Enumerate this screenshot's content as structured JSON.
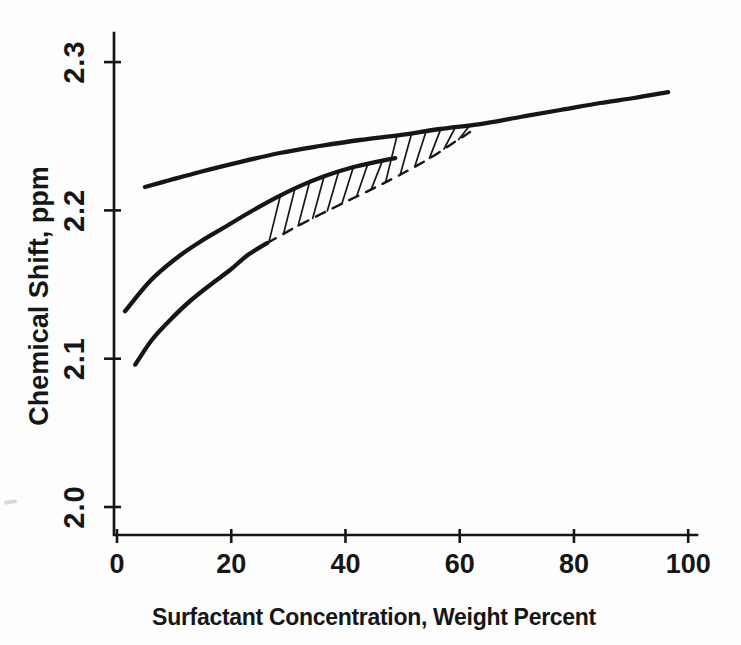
{
  "figure": {
    "background": "#fdfdfd",
    "ink_color": "#161616"
  },
  "chart_data": {
    "type": "line",
    "title": "",
    "xlabel": "Surfactant Concentration, Weight Percent",
    "ylabel": "Chemical Shift, ppm",
    "xlim": [
      0,
      101.5
    ],
    "ylim": [
      1.98,
      2.32
    ],
    "grid": false,
    "legend": "none",
    "x_ticks": {
      "values": [
        0,
        20,
        40,
        60,
        80,
        100
      ],
      "labels": [
        "0",
        "20",
        "40",
        "60",
        "80",
        "100"
      ]
    },
    "y_ticks": {
      "values": [
        2.0,
        2.1,
        2.2,
        2.3
      ],
      "labels": [
        "2.0",
        "2.1",
        "2.2",
        "2.3"
      ]
    },
    "series": [
      {
        "name": "upper-curve",
        "line": "solid",
        "x": [
          4.9,
          9.3,
          14.5,
          21.5,
          28.5,
          35.5,
          42.5,
          49.5,
          56.6,
          63.6,
          70.6,
          77.6,
          84.6,
          90.5,
          96.5
        ],
        "y": [
          2.2158,
          2.2205,
          2.2259,
          2.2326,
          2.2387,
          2.2434,
          2.2475,
          2.2508,
          2.2549,
          2.2582,
          2.263,
          2.2677,
          2.2724,
          2.2758,
          2.2798
        ]
      },
      {
        "name": "two-phase-upper-boundary-curve",
        "line": "solid",
        "x": [
          1.4,
          5.8,
          10.2,
          14.5,
          18.9,
          23.3,
          27.7,
          32.0,
          36.4,
          40.8,
          45.2,
          48.7
        ],
        "y": [
          2.132,
          2.1524,
          2.1672,
          2.1787,
          2.1888,
          2.1989,
          2.2083,
          2.2164,
          2.2232,
          2.2286,
          2.2326,
          2.2353
        ]
      },
      {
        "name": "lower-curve",
        "line": "solid",
        "x": [
          3.2,
          6.1,
          9.3,
          12.8,
          16.3,
          19.8,
          22.9,
          26.3
        ],
        "y": [
          2.096,
          2.1126,
          2.1261,
          2.1389,
          2.1497,
          2.1598,
          2.1699,
          2.178
        ]
      },
      {
        "name": "two-phase-lower-boundary",
        "line": "dashed",
        "x": [
          26.3,
          32.0,
          38.2,
          44.3,
          49.5,
          54.8,
          58.6,
          61.8
        ],
        "y": [
          2.178,
          2.1902,
          2.2023,
          2.2137,
          2.2239,
          2.2353,
          2.2448,
          2.2529
        ]
      }
    ],
    "hatch_region": {
      "description": "diagonal hatch marks between dashed lower boundary and upper curves, closing at ~63 wt%",
      "lower_series": "two-phase-lower-boundary",
      "upper_series": [
        "two-phase-upper-boundary-curve",
        "upper-curve"
      ],
      "upper_switch_x": 48.7,
      "x_start": 26.6,
      "x_end": 59.8,
      "count": 14,
      "lean_dx": 2.0
    }
  }
}
